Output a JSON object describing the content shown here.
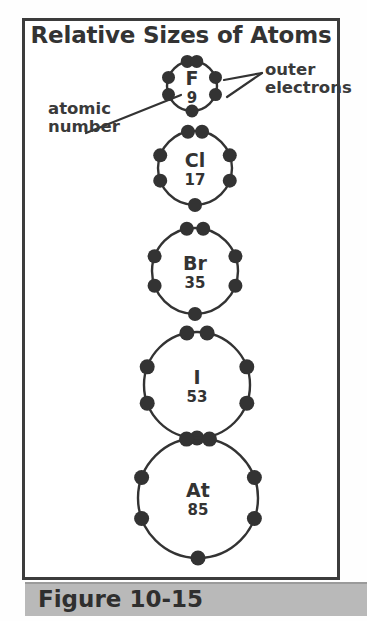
{
  "figure": {
    "title": "Relative Sizes of Atoms",
    "caption": "Figure 10-15"
  },
  "annotations": {
    "atomic_number_label": "atomic\nnumber",
    "outer_electrons_label": "outer\nelectrons"
  },
  "colors": {
    "ink": "#333333",
    "frame": "#3c3c3c",
    "caption_band": "#b9b9b9",
    "background": "#ffffff"
  },
  "chart_data": {
    "type": "diagram",
    "title": "Relative Sizes of Atoms",
    "categories": [
      "F",
      "Cl",
      "Br",
      "I",
      "At"
    ],
    "values": [
      50,
      74,
      86,
      106,
      120
    ],
    "ylabel": "Relative atomic size (circle diameter, px)",
    "atoms": [
      {
        "symbol": "F",
        "atomic_number": "9",
        "outer_electrons": 7,
        "cx": 192,
        "cy": 86,
        "r": 25,
        "symbol_font_size": 19,
        "number_font_size": 15,
        "dot_r": 6.5
      },
      {
        "symbol": "Cl",
        "atomic_number": "17",
        "outer_electrons": 7,
        "cx": 195,
        "cy": 168,
        "r": 37,
        "symbol_font_size": 19,
        "number_font_size": 15,
        "dot_r": 7
      },
      {
        "symbol": "Br",
        "atomic_number": "35",
        "outer_electrons": 7,
        "cx": 195,
        "cy": 271,
        "r": 43,
        "symbol_font_size": 19,
        "number_font_size": 15,
        "dot_r": 7
      },
      {
        "symbol": "I",
        "atomic_number": "53",
        "outer_electrons": 7,
        "cx": 197,
        "cy": 385,
        "r": 53,
        "symbol_font_size": 19,
        "number_font_size": 15,
        "dot_r": 7.5
      },
      {
        "symbol": "At",
        "atomic_number": "85",
        "outer_electrons": 7,
        "cx": 198,
        "cy": 498,
        "r": 60,
        "symbol_font_size": 19,
        "number_font_size": 15,
        "dot_r": 7.5
      }
    ],
    "electron_angles_deg": [
      -101,
      -79,
      -20,
      20,
      160,
      200,
      90
    ],
    "leader_lines": [
      {
        "name": "atomic-number-leader",
        "x1": 86,
        "y1": 133,
        "x2": 181,
        "y2": 95
      },
      {
        "name": "outer-electrons-leader-upper",
        "x1": 262,
        "y1": 73,
        "x2": 224,
        "y2": 80
      },
      {
        "name": "outer-electrons-leader-lower",
        "x1": 262,
        "y1": 73,
        "x2": 227,
        "y2": 97
      }
    ]
  }
}
